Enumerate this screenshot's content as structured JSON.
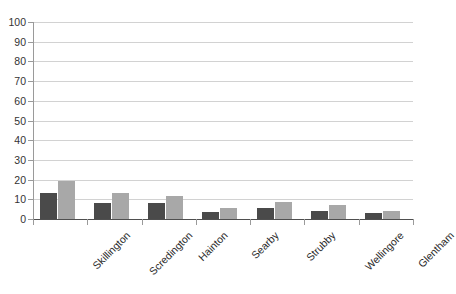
{
  "chart_data": {
    "type": "bar",
    "title": "",
    "subtitle": "",
    "xlabel": "",
    "ylabel": "",
    "ylim": [
      0,
      100
    ],
    "yticks": [
      0,
      10,
      20,
      30,
      40,
      50,
      60,
      70,
      80,
      90,
      100
    ],
    "grid": true,
    "legend": "none",
    "categories": [
      "Skillington",
      "Scredington",
      "Hainton",
      "Searby",
      "Strubby",
      "Wellingore",
      "Glentham"
    ],
    "series": [
      {
        "name": "series-1",
        "color": "#4a4a4a",
        "values": [
          13,
          8,
          8,
          3.5,
          5.5,
          4,
          3
        ]
      },
      {
        "name": "series-2",
        "color": "#a8a8a8",
        "values": [
          19.5,
          13,
          11.5,
          5.5,
          8.5,
          7,
          4
        ]
      }
    ]
  },
  "axis": {
    "y_tick_labels": [
      "100",
      "90",
      "80",
      "70",
      "60",
      "50",
      "40",
      "30",
      "20",
      "10",
      "0"
    ]
  },
  "colors": {
    "series_dark": "#4a4a4a",
    "series_light": "#a8a8a8",
    "gridline": "#d2d2d2",
    "axis": "#9a9a9a",
    "baseline": "#4f4f4f",
    "text": "#333333",
    "background": "#ffffff"
  }
}
